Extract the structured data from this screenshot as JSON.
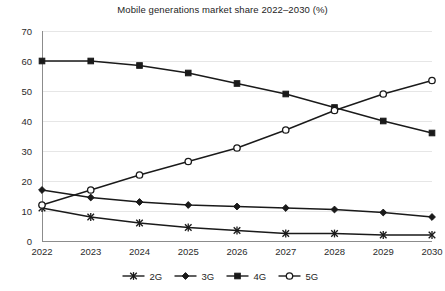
{
  "chart_data": {
    "type": "line",
    "title": "Mobile generations market share 2022–2030 (%)",
    "xlabel": "",
    "ylabel": "",
    "categories": [
      "2022",
      "2023",
      "2024",
      "2025",
      "2026",
      "2027",
      "2028",
      "2029",
      "2030"
    ],
    "x": [
      2022,
      2023,
      2024,
      2025,
      2026,
      2027,
      2028,
      2029,
      2030
    ],
    "ylim": [
      0,
      70
    ],
    "yticks": [
      0,
      10,
      20,
      30,
      40,
      50,
      60,
      70
    ],
    "ytick_labels": [
      "0",
      "10",
      "20",
      "30",
      "40",
      "50",
      "60",
      "70"
    ],
    "grid": true,
    "grid_axis": "y",
    "legend_position": "bottom",
    "series": [
      {
        "name": "2G",
        "marker": "cross",
        "color": "#1a1a1a",
        "values": [
          11,
          8,
          6,
          4.5,
          3.5,
          2.5,
          2.5,
          2,
          2
        ]
      },
      {
        "name": "3G",
        "marker": "diamond",
        "color": "#1a1a1a",
        "values": [
          17,
          14.5,
          13,
          12,
          11.5,
          11,
          10.5,
          9.5,
          8
        ]
      },
      {
        "name": "4G",
        "marker": "square",
        "color": "#1a1a1a",
        "values": [
          60,
          60,
          58.5,
          56,
          52.5,
          49,
          44.5,
          40,
          36
        ]
      },
      {
        "name": "5G",
        "marker": "circle-open",
        "color": "#1a1a1a",
        "values": [
          12,
          17,
          22,
          26.5,
          31,
          37,
          43.5,
          49,
          53.5
        ]
      }
    ]
  },
  "legend": {
    "entries": [
      {
        "label": "2G",
        "marker": "cross"
      },
      {
        "label": "3G",
        "marker": "diamond"
      },
      {
        "label": "4G",
        "marker": "square"
      },
      {
        "label": "5G",
        "marker": "circle-open"
      }
    ]
  }
}
